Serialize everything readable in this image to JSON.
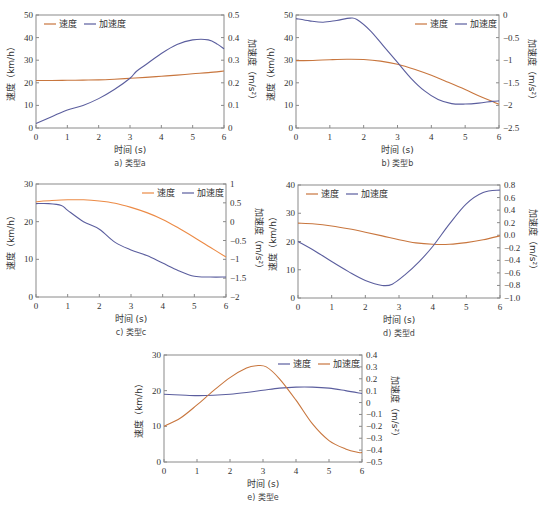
{
  "colors": {
    "orange": "#c8763e",
    "orange_bright": "#ec8a45",
    "blue": "#5b5e9e",
    "axis": "#8a8a8a"
  },
  "chart_data": [
    {
      "id": "a",
      "type": "line",
      "caption": "a) 类型a",
      "xlabel": "时间 (s)",
      "ylabel": "速度（km/h）",
      "y2label": "加速度（m/s²）",
      "xlim": [
        0,
        6
      ],
      "xticks": [
        0,
        1,
        2,
        3,
        4,
        5,
        6
      ],
      "ylim": [
        0,
        50
      ],
      "yticks": [
        0,
        10,
        20,
        30,
        40,
        50
      ],
      "y2lim": [
        0,
        0.5
      ],
      "y2ticks": [
        "0",
        "0.1",
        "0.2",
        "0.3",
        "0.4",
        "0.5"
      ],
      "legend_position": "upper-left",
      "series": [
        {
          "name": "速度",
          "axis": "left",
          "color": "#c8763e",
          "x": [
            0,
            0.5,
            1,
            1.5,
            2,
            2.5,
            3,
            3.5,
            4,
            4.5,
            5,
            5.5,
            6
          ],
          "values": [
            21,
            21,
            21.1,
            21.2,
            21.3,
            21.6,
            22,
            22.4,
            22.9,
            23.4,
            24,
            24.5,
            25.2
          ]
        },
        {
          "name": "加速度",
          "axis": "right",
          "color": "#5b5e9e",
          "x": [
            0,
            0.5,
            1,
            1.5,
            2,
            2.5,
            3,
            3.2,
            3.5,
            4,
            4.5,
            5,
            5.5,
            5.8,
            6
          ],
          "values": [
            0.02,
            0.05,
            0.08,
            0.1,
            0.13,
            0.17,
            0.22,
            0.25,
            0.28,
            0.33,
            0.37,
            0.39,
            0.39,
            0.37,
            0.35
          ]
        }
      ]
    },
    {
      "id": "b",
      "type": "line",
      "caption": "b) 类型b",
      "xlabel": "时间 (s)",
      "ylabel": "速度（km/h）",
      "y2label": "加速度（m/s²）",
      "xlim": [
        0,
        6
      ],
      "xticks": [
        0,
        1,
        2,
        3,
        4,
        5,
        6
      ],
      "ylim": [
        0,
        50
      ],
      "yticks": [
        0,
        10,
        20,
        30,
        40,
        50
      ],
      "y2lim": [
        -2.5,
        0
      ],
      "y2ticks": [
        "-2.5",
        "-2",
        "-1.5",
        "-1",
        "-0.5",
        "0"
      ],
      "legend_position": "upper-right",
      "series": [
        {
          "name": "速度",
          "axis": "left",
          "color": "#c8763e",
          "x": [
            0,
            0.5,
            1,
            1.5,
            2,
            2.5,
            3,
            3.5,
            4,
            4.5,
            5,
            5.5,
            6
          ],
          "values": [
            29.8,
            29.9,
            30.2,
            30.4,
            30.3,
            29.6,
            28.2,
            26,
            23.3,
            20.2,
            17,
            13.6,
            10.5
          ]
        },
        {
          "name": "加速度",
          "axis": "right",
          "color": "#5b5e9e",
          "x": [
            0,
            0.4,
            0.8,
            1.2,
            1.6,
            1.8,
            2.2,
            2.6,
            3,
            3.4,
            3.8,
            4.2,
            4.6,
            5,
            5.4,
            5.8,
            6
          ],
          "values": [
            -0.08,
            -0.13,
            -0.16,
            -0.12,
            -0.07,
            -0.1,
            -0.35,
            -0.7,
            -1.05,
            -1.4,
            -1.68,
            -1.87,
            -1.96,
            -1.97,
            -1.95,
            -1.91,
            -1.9
          ]
        }
      ]
    },
    {
      "id": "c",
      "type": "line",
      "caption": "c) 类型c",
      "xlabel": "时间 (s)",
      "ylabel": "速度（km/h）",
      "y2label": "加速度（m/s²）",
      "xlim": [
        0,
        6
      ],
      "xticks": [
        0,
        1,
        2,
        3,
        4,
        5,
        6
      ],
      "ylim": [
        0,
        30
      ],
      "yticks": [
        0,
        10,
        20,
        30
      ],
      "y2lim": [
        -2,
        1
      ],
      "y2ticks": [
        "-2",
        "-1.5",
        "-1",
        "-0.5",
        "0",
        "0.5",
        "1"
      ],
      "legend_position": "upper-right",
      "series": [
        {
          "name": "速度",
          "axis": "left",
          "color": "#ec8a45",
          "x": [
            0,
            0.5,
            1,
            1.5,
            2,
            2.5,
            3,
            3.5,
            4,
            4.5,
            5,
            5.5,
            6
          ],
          "values": [
            25.3,
            25.6,
            25.8,
            25.8,
            25.5,
            24.9,
            23.8,
            22.4,
            20.6,
            18.3,
            15.8,
            13.2,
            10.6
          ]
        },
        {
          "name": "加速度",
          "axis": "right",
          "color": "#5b5e9e",
          "x": [
            0,
            0.4,
            0.8,
            1,
            1.5,
            2,
            2.5,
            3,
            3.5,
            4,
            4.5,
            5,
            5.5,
            6
          ],
          "values": [
            0.48,
            0.48,
            0.43,
            0.3,
            0,
            -0.2,
            -0.55,
            -0.75,
            -0.9,
            -1.1,
            -1.3,
            -1.45,
            -1.47,
            -1.47
          ]
        }
      ]
    },
    {
      "id": "d",
      "type": "line",
      "caption": "d) 类型d",
      "xlabel": "时间 (s)",
      "ylabel": "速度（km/h）",
      "y2label": "加速度（m/s²）",
      "xlim": [
        0,
        6
      ],
      "xticks": [
        0,
        1,
        2,
        3,
        4,
        5,
        6
      ],
      "ylim": [
        0,
        40
      ],
      "yticks": [
        0,
        10,
        20,
        30,
        40
      ],
      "y2lim": [
        -1.0,
        0.8
      ],
      "y2ticks": [
        "-1.0",
        "-0.8",
        "-0.6",
        "-0.4",
        "-0.2",
        "0.0",
        "0.2",
        "0.4",
        "0.6",
        "0.8"
      ],
      "legend_position": "upper-left",
      "series": [
        {
          "name": "速度",
          "axis": "left",
          "color": "#c8763e",
          "x": [
            0,
            0.5,
            1,
            1.5,
            2,
            2.5,
            3,
            3.5,
            4,
            4.5,
            5,
            5.5,
            6
          ],
          "values": [
            26.5,
            26.2,
            25.5,
            24.5,
            23.3,
            22,
            20.6,
            19.5,
            19,
            19,
            19.6,
            20.6,
            22
          ]
        },
        {
          "name": "加速度",
          "axis": "right",
          "color": "#5b5e9e",
          "x": [
            0,
            0.5,
            1,
            1.5,
            2,
            2.5,
            2.8,
            3.2,
            3.6,
            4,
            4.5,
            5,
            5.5,
            6
          ],
          "values": [
            -0.1,
            -0.25,
            -0.42,
            -0.58,
            -0.72,
            -0.8,
            -0.78,
            -0.62,
            -0.42,
            -0.18,
            0.18,
            0.5,
            0.68,
            0.72
          ]
        }
      ]
    },
    {
      "id": "e",
      "type": "line",
      "caption": "e) 类型e",
      "xlabel": "时间 (s)",
      "ylabel": "速度（km/h）",
      "y2label": "加速度（m/s²）",
      "xlim": [
        0,
        6
      ],
      "xticks": [
        0,
        1,
        2,
        3,
        4,
        5,
        6
      ],
      "ylim": [
        0,
        30
      ],
      "yticks": [
        0,
        10,
        20,
        30
      ],
      "y2lim": [
        -0.5,
        0.4
      ],
      "y2ticks": [
        "-0.5",
        "-0.4",
        "-0.3",
        "-0.2",
        "-0.1",
        "0",
        "0.1",
        "0.2",
        "0.3",
        "0.4"
      ],
      "legend_position": "upper-right",
      "series": [
        {
          "name": "速度",
          "axis": "left",
          "color": "#5b5e9e",
          "x": [
            0,
            0.5,
            1,
            1.5,
            2,
            2.5,
            3,
            3.5,
            4,
            4.5,
            5,
            5.5,
            6
          ],
          "values": [
            19,
            18.8,
            18.6,
            18.7,
            19,
            19.5,
            20.1,
            20.7,
            21,
            21,
            20.7,
            20,
            19.2
          ]
        },
        {
          "name": "加速度",
          "axis": "right",
          "color": "#c8763e",
          "x": [
            0,
            0.5,
            1,
            1.5,
            2,
            2.5,
            2.8,
            3.1,
            3.5,
            4,
            4.5,
            5,
            5.5,
            5.9,
            6
          ],
          "values": [
            -0.2,
            -0.13,
            -0.02,
            0.1,
            0.21,
            0.29,
            0.31,
            0.3,
            0.2,
            0.02,
            -0.18,
            -0.32,
            -0.39,
            -0.42,
            -0.42
          ]
        }
      ]
    }
  ]
}
